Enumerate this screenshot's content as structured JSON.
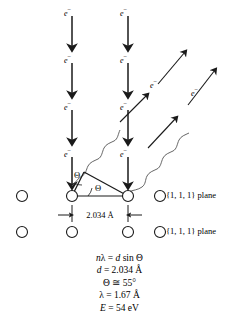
{
  "figure": {
    "colors": {
      "stroke": "#1a1a1a",
      "background": "#ffffff",
      "wave": "#4a4a4a"
    }
  },
  "electron_labels": [
    {
      "id": "e-top-left",
      "text": "e",
      "sup": "−",
      "x": 64,
      "y": 6
    },
    {
      "id": "e-top-right",
      "text": "e",
      "sup": "−",
      "x": 120,
      "y": 6
    },
    {
      "id": "e-mid1-left",
      "text": "e",
      "sup": "−",
      "x": 64,
      "y": 54
    },
    {
      "id": "e-mid1-right",
      "text": "e",
      "sup": "−",
      "x": 120,
      "y": 54
    },
    {
      "id": "e-mid2-left",
      "text": "e",
      "sup": "−",
      "x": 64,
      "y": 101
    },
    {
      "id": "e-mid2-right",
      "text": "e",
      "sup": "−",
      "x": 120,
      "y": 101
    },
    {
      "id": "e-low-left",
      "text": "e",
      "sup": "−",
      "x": 64,
      "y": 148
    },
    {
      "id": "e-low-right",
      "text": "e",
      "sup": "−",
      "x": 120,
      "y": 148
    },
    {
      "id": "e-diag-inner",
      "text": "e",
      "sup": "−",
      "x": 152,
      "y": 78
    },
    {
      "id": "e-diag-outer",
      "text": "e",
      "sup": "−",
      "x": 193,
      "y": 86
    }
  ],
  "angle_labels": [
    {
      "id": "theta-apex",
      "text": "Θ",
      "x": 75,
      "y": 172
    },
    {
      "id": "theta-base",
      "text": "Θ",
      "x": 96,
      "y": 185
    }
  ],
  "dimension": {
    "label": "2.034 Å",
    "from_x": 72,
    "to_x": 128
  },
  "plane_labels": {
    "top": "{1, 1, 1} plane",
    "bottom": "{1, 1, 1} plane"
  },
  "atoms": {
    "row_top_y": 196,
    "row_bottom_y": 232,
    "radius": 5.5,
    "row_top_x": [
      22,
      72,
      128
    ],
    "row_bottom_x": [
      22,
      72,
      128
    ],
    "legend_top_x": 160,
    "legend_bottom_x": 160
  },
  "equations": [
    {
      "id": "bragg-condition",
      "html": "<span class=\"it\">n</span>λ = <span class=\"it\">d</span> sin Θ"
    },
    {
      "id": "spacing",
      "html": "<span class=\"it\">d</span> = 2.034 Å"
    },
    {
      "id": "angle",
      "html": "Θ ≅ 55°"
    },
    {
      "id": "wavelength",
      "html": "λ = 1.67 Å"
    },
    {
      "id": "energy",
      "html": "<span class=\"it\">E</span> = 54 eV"
    }
  ],
  "chart_data": {
    "type": "diagram",
    "quantities": [
      {
        "symbol": "nλ",
        "relation": "=",
        "value": "d sin Θ"
      },
      {
        "symbol": "d",
        "relation": "=",
        "value": "2.034 Å"
      },
      {
        "symbol": "Θ",
        "relation": "≅",
        "value": "55°"
      },
      {
        "symbol": "λ",
        "relation": "=",
        "value": "1.67 Å"
      },
      {
        "symbol": "E",
        "relation": "=",
        "value": "54 eV"
      }
    ],
    "incident_beams": 2,
    "diffracted_beams": 2,
    "lattice_rows": 2,
    "lattice_spacing": "2.034 Å"
  }
}
